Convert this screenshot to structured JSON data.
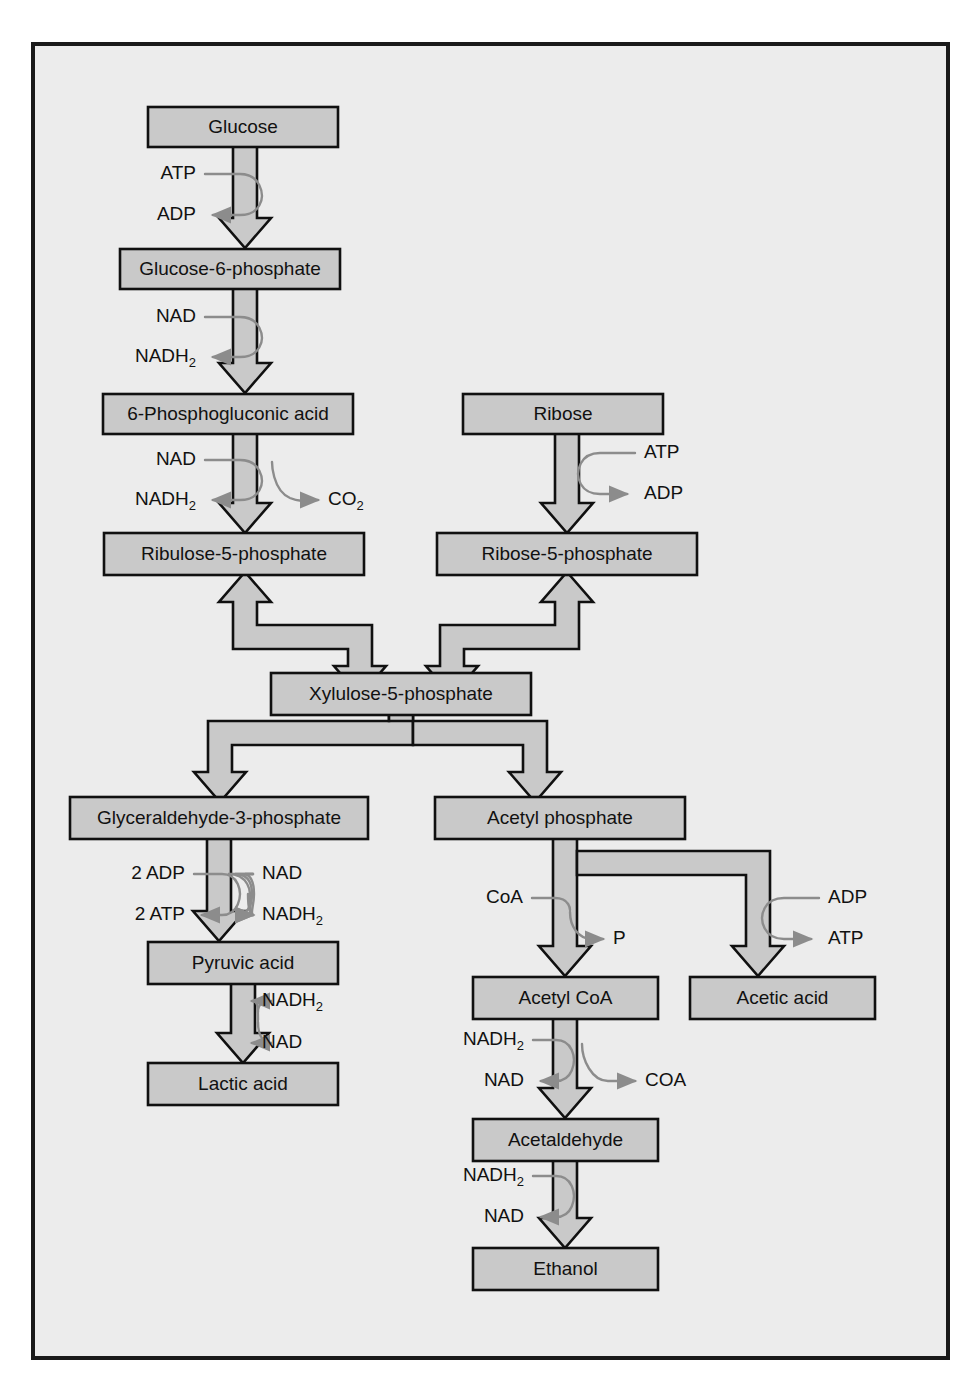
{
  "figure": {
    "page_background": "#ffffff",
    "panel_background": "#ececec",
    "panel_border_color": "#1a1a1a",
    "box_fill": "#c9c9c9",
    "box_border_color": "#101010",
    "arrow_fill": "#c9c9c9",
    "arrow_stroke": "#101010",
    "cofactor_curve_color": "#8c8c8c",
    "text_color": "#111111"
  },
  "boxes": [
    {
      "id": "glucose",
      "label": "Glucose",
      "x": 148,
      "y": 107,
      "w": 190,
      "h": 40
    },
    {
      "id": "glucose6p",
      "label": "Glucose-6-phosphate",
      "x": 120,
      "y": 249,
      "w": 220,
      "h": 40
    },
    {
      "id": "phosphogluconic",
      "label": "6-Phosphogluconic acid",
      "x": 103,
      "y": 394,
      "w": 250,
      "h": 40
    },
    {
      "id": "ribose",
      "label": "Ribose",
      "x": 463,
      "y": 394,
      "w": 200,
      "h": 40
    },
    {
      "id": "ribulose5p",
      "label": "Ribulose-5-phosphate",
      "x": 104,
      "y": 533,
      "w": 260,
      "h": 42
    },
    {
      "id": "ribose5p",
      "label": "Ribose-5-phosphate",
      "x": 437,
      "y": 533,
      "w": 260,
      "h": 42
    },
    {
      "id": "xylulose5p",
      "label": "Xylulose-5-phosphate",
      "x": 271,
      "y": 673,
      "w": 260,
      "h": 42
    },
    {
      "id": "glyceraldehyde3p",
      "label": "Glyceraldehyde-3-phosphate",
      "x": 70,
      "y": 797,
      "w": 298,
      "h": 42
    },
    {
      "id": "acetylphosphate",
      "label": "Acetyl phosphate",
      "x": 435,
      "y": 797,
      "w": 250,
      "h": 42
    },
    {
      "id": "pyruvic",
      "label": "Pyruvic acid",
      "x": 148,
      "y": 942,
      "w": 190,
      "h": 42
    },
    {
      "id": "lactic",
      "label": "Lactic acid",
      "x": 148,
      "y": 1063,
      "w": 190,
      "h": 42
    },
    {
      "id": "acetylcoa",
      "label": "Acetyl CoA",
      "x": 473,
      "y": 977,
      "w": 185,
      "h": 42
    },
    {
      "id": "aceticacid",
      "label": "Acetic acid",
      "x": 690,
      "y": 977,
      "w": 185,
      "h": 42
    },
    {
      "id": "acetaldehyde",
      "label": "Acetaldehyde",
      "x": 473,
      "y": 1119,
      "w": 185,
      "h": 42
    },
    {
      "id": "ethanol",
      "label": "Ethanol",
      "x": 473,
      "y": 1248,
      "w": 185,
      "h": 42
    }
  ],
  "cofactors": [
    {
      "id": "atp-in-glucose",
      "label": "ATP",
      "x": 196,
      "y": 174,
      "align": "end"
    },
    {
      "id": "adp-out-glucose",
      "label": "ADP",
      "x": 196,
      "y": 215,
      "align": "end"
    },
    {
      "id": "nad-in-g6p",
      "label": "NAD",
      "x": 196,
      "y": 317,
      "align": "end"
    },
    {
      "id": "nadh2-out-g6p",
      "label": "NADH",
      "sub": "2",
      "x": 196,
      "y": 357,
      "align": "end"
    },
    {
      "id": "nad-in-pg",
      "label": "NAD",
      "x": 196,
      "y": 460,
      "align": "end"
    },
    {
      "id": "nadh2-out-pg",
      "label": "NADH",
      "sub": "2",
      "x": 196,
      "y": 500,
      "align": "end"
    },
    {
      "id": "co2-out-pg",
      "label": "CO",
      "sub": "2",
      "x": 328,
      "y": 500,
      "align": "start"
    },
    {
      "id": "atp-in-ribose",
      "label": "ATP",
      "x": 644,
      "y": 453,
      "align": "start"
    },
    {
      "id": "adp-out-ribose",
      "label": "ADP",
      "x": 644,
      "y": 494,
      "align": "start"
    },
    {
      "id": "adp2-in-g3p",
      "label": "2 ADP",
      "x": 185,
      "y": 874,
      "align": "end"
    },
    {
      "id": "atp2-out-g3p",
      "label": "2 ATP",
      "x": 185,
      "y": 915,
      "align": "end"
    },
    {
      "id": "nad-in-g3p",
      "label": "NAD",
      "x": 262,
      "y": 874,
      "align": "start"
    },
    {
      "id": "nadh2-out-g3p",
      "label": "NADH",
      "sub": "2",
      "x": 262,
      "y": 915,
      "align": "start"
    },
    {
      "id": "nadh2-out-pyruvic",
      "label": "NADH",
      "sub": "2",
      "x": 262,
      "y": 1001,
      "align": "start"
    },
    {
      "id": "nad-out-pyruvic",
      "label": "NAD",
      "x": 262,
      "y": 1043,
      "align": "start"
    },
    {
      "id": "coa-in-acp",
      "label": "CoA",
      "x": 523,
      "y": 898,
      "align": "end"
    },
    {
      "id": "p-out-acp",
      "label": "P",
      "x": 613,
      "y": 939,
      "align": "start"
    },
    {
      "id": "adp-in-acetic",
      "label": "ADP",
      "x": 828,
      "y": 898,
      "align": "start"
    },
    {
      "id": "atp-out-acetic",
      "label": "ATP",
      "x": 828,
      "y": 939,
      "align": "start"
    },
    {
      "id": "nadh2-in-acoa",
      "label": "NADH",
      "sub": "2",
      "x": 524,
      "y": 1040,
      "align": "end"
    },
    {
      "id": "nad-out-acoa",
      "label": "NAD",
      "x": 524,
      "y": 1081,
      "align": "end"
    },
    {
      "id": "coa-out-acoa",
      "label": "COA",
      "x": 645,
      "y": 1081,
      "align": "start"
    },
    {
      "id": "nadh2-in-acetal",
      "label": "NADH",
      "sub": "2",
      "x": 524,
      "y": 1176,
      "align": "end"
    },
    {
      "id": "nad-out-acetal",
      "label": "NAD",
      "x": 524,
      "y": 1217,
      "align": "end"
    }
  ]
}
